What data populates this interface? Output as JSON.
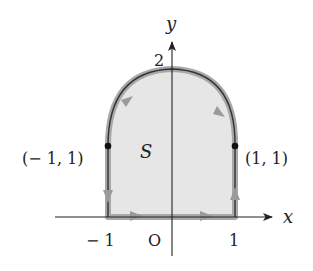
{
  "figure": {
    "type": "region-with-oriented-boundary",
    "axes": {
      "x_label": "x",
      "y_label": "y",
      "origin_label": "O",
      "x_ticks": [
        "− 1",
        "1"
      ],
      "y_ticks": [
        "2"
      ]
    },
    "region": {
      "label": "S",
      "description": "Region bounded by x=-1, x=1, y=0 and an upper arc y = 2 - x^2 from (-1,1) to (1,1)",
      "fill_color": "#e6e6e6",
      "boundary_band_color": "#a8a8a8",
      "curve_color": "#333333"
    },
    "points": [
      {
        "label": "(− 1, 1)",
        "x": -1,
        "y": 1
      },
      {
        "label": "(1, 1)",
        "x": 1,
        "y": 1
      }
    ],
    "orientation": "counterclockwise",
    "arrows": [
      {
        "segment": "bottom",
        "direction": "right",
        "count": 2
      },
      {
        "segment": "right-side",
        "direction": "up"
      },
      {
        "segment": "arc-right",
        "direction": "down-right"
      },
      {
        "segment": "arc-left",
        "direction": "up-right"
      },
      {
        "segment": "left-side",
        "direction": "down"
      }
    ]
  }
}
